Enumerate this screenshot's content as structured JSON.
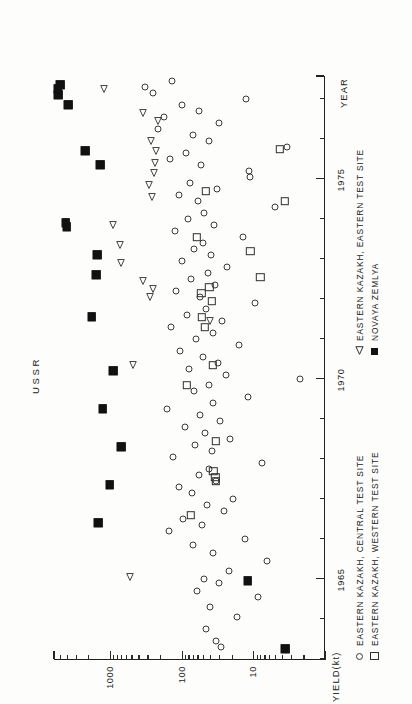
{
  "chart_data": {
    "type": "scatter",
    "title": "USSR",
    "xlabel": "YEAR",
    "ylabel": "YIELD(kt)",
    "yscale": "log",
    "xlim": [
      1963.0,
      1977.6
    ],
    "ylim": [
      1.0,
      6000.0
    ],
    "xticks": [
      1965,
      1970,
      1975
    ],
    "xtick_labels": [
      "1965",
      "1970",
      "1975"
    ],
    "xminor_step": 1,
    "yticks": [
      10,
      100,
      1000
    ],
    "ytick_labels": [
      "10",
      "100",
      "1000"
    ],
    "grid": false,
    "legend_position": "below-axes",
    "legend": [
      {
        "symbol": "open-circle",
        "label": "EASTERN KAZAKH, CENTRAL TEST SITE"
      },
      {
        "symbol": "open-square",
        "label": "EASTERN KAZAKH, WESTERN TEST SITE"
      },
      {
        "symbol": "open-triangle",
        "label": "EASTERN KAZAKH, EASTERN TEST SITE"
      },
      {
        "symbol": "filled-square",
        "label": "NOVAYA ZEMLYA"
      }
    ],
    "series": [
      {
        "name": "EASTERN KAZAKH, CENTRAL TEST SITE",
        "symbol": "open-circle",
        "points": [
          [
            1963.3,
            28
          ],
          [
            1963.45,
            33
          ],
          [
            1963.75,
            46
          ],
          [
            1964.05,
            17
          ],
          [
            1964.3,
            40
          ],
          [
            1964.55,
            8.5
          ],
          [
            1964.7,
            60
          ],
          [
            1964.9,
            30
          ],
          [
            1965.0,
            48
          ],
          [
            1965.2,
            22
          ],
          [
            1965.45,
            6.5
          ],
          [
            1965.65,
            36
          ],
          [
            1965.85,
            70
          ],
          [
            1966.0,
            13
          ],
          [
            1966.2,
            150
          ],
          [
            1966.35,
            52
          ],
          [
            1966.5,
            95
          ],
          [
            1966.7,
            26
          ],
          [
            1966.85,
            44
          ],
          [
            1967.0,
            19
          ],
          [
            1967.15,
            72
          ],
          [
            1967.3,
            110
          ],
          [
            1967.45,
            33
          ],
          [
            1967.6,
            58
          ],
          [
            1967.75,
            42
          ],
          [
            1967.9,
            7.5
          ],
          [
            1968.05,
            130
          ],
          [
            1968.2,
            38
          ],
          [
            1968.35,
            64
          ],
          [
            1968.5,
            21
          ],
          [
            1968.65,
            47
          ],
          [
            1968.8,
            90
          ],
          [
            1968.95,
            29
          ],
          [
            1969.1,
            55
          ],
          [
            1969.25,
            160
          ],
          [
            1969.4,
            36
          ],
          [
            1969.55,
            12
          ],
          [
            1969.7,
            68
          ],
          [
            1969.85,
            41
          ],
          [
            1970.0,
            2.2
          ],
          [
            1970.1,
            24
          ],
          [
            1970.25,
            78
          ],
          [
            1970.4,
            31
          ],
          [
            1970.55,
            50
          ],
          [
            1970.7,
            105
          ],
          [
            1970.85,
            16
          ],
          [
            1971.0,
            62
          ],
          [
            1971.15,
            37
          ],
          [
            1971.3,
            140
          ],
          [
            1971.45,
            27
          ],
          [
            1971.6,
            85
          ],
          [
            1971.75,
            45
          ],
          [
            1971.9,
            9.5
          ],
          [
            1972.05,
            56
          ],
          [
            1972.2,
            118
          ],
          [
            1972.35,
            34
          ],
          [
            1972.5,
            73
          ],
          [
            1972.65,
            43
          ],
          [
            1972.8,
            23
          ],
          [
            1972.95,
            98
          ],
          [
            1973.1,
            39
          ],
          [
            1973.25,
            66
          ],
          [
            1973.4,
            51
          ],
          [
            1973.55,
            14
          ],
          [
            1973.7,
            125
          ],
          [
            1973.85,
            35
          ],
          [
            1974.0,
            80
          ],
          [
            1974.15,
            49
          ],
          [
            1974.3,
            5.0
          ],
          [
            1974.45,
            59
          ],
          [
            1974.6,
            108
          ],
          [
            1974.75,
            32
          ],
          [
            1974.9,
            76
          ],
          [
            1975.05,
            11
          ],
          [
            1975.2,
            11.5
          ],
          [
            1975.35,
            54
          ],
          [
            1975.5,
            145
          ],
          [
            1975.65,
            88
          ],
          [
            1975.8,
            3.4
          ],
          [
            1975.95,
            41
          ],
          [
            1976.1,
            69
          ],
          [
            1976.25,
            210
          ],
          [
            1976.4,
            30
          ],
          [
            1976.55,
            175
          ],
          [
            1976.7,
            57
          ],
          [
            1976.85,
            100
          ],
          [
            1977.0,
            12.5
          ],
          [
            1977.15,
            250
          ],
          [
            1977.3,
            320
          ],
          [
            1977.45,
            135
          ]
        ]
      },
      {
        "name": "EASTERN KAZAKH, WESTERN TEST SITE",
        "symbol": "open-square",
        "points": [
          [
            1966.6,
            75
          ],
          [
            1967.55,
            34
          ],
          [
            1967.7,
            36
          ],
          [
            1968.45,
            33
          ],
          [
            1969.85,
            84
          ],
          [
            1970.35,
            37
          ],
          [
            1971.3,
            47
          ],
          [
            1971.55,
            52
          ],
          [
            1971.95,
            38
          ],
          [
            1972.15,
            53
          ],
          [
            1972.3,
            41
          ],
          [
            1972.55,
            8.0
          ],
          [
            1973.2,
            11
          ],
          [
            1973.55,
            61
          ],
          [
            1974.45,
            3.6
          ],
          [
            1974.7,
            46
          ],
          [
            1975.75,
            4.3
          ],
          [
            1967.45,
            33.5
          ]
        ]
      },
      {
        "name": "EASTERN KAZAKH, EASTERN TEST SITE",
        "symbol": "open-triangle",
        "points": [
          [
            1965.05,
            640
          ],
          [
            1970.35,
            570
          ],
          [
            1971.45,
            48
          ],
          [
            1972.05,
            330
          ],
          [
            1972.25,
            300
          ],
          [
            1972.9,
            850
          ],
          [
            1973.35,
            880
          ],
          [
            1973.85,
            1100
          ],
          [
            1974.55,
            310
          ],
          [
            1974.85,
            340
          ],
          [
            1975.15,
            290
          ],
          [
            1975.4,
            280
          ],
          [
            1975.7,
            270
          ],
          [
            1975.95,
            320
          ],
          [
            1976.45,
            260
          ],
          [
            1976.65,
            420
          ],
          [
            1977.25,
            1450
          ],
          [
            1972.45,
            410
          ]
        ]
      },
      {
        "name": "NOVAYA ZEMLYA",
        "symbol": "filled-square",
        "points": [
          [
            1963.25,
            3.6
          ],
          [
            1964.95,
            12
          ],
          [
            1966.4,
            1450
          ],
          [
            1967.35,
            1000
          ],
          [
            1968.3,
            700
          ],
          [
            1969.25,
            1250
          ],
          [
            1970.2,
            900
          ],
          [
            1971.55,
            1800
          ],
          [
            1972.6,
            1550
          ],
          [
            1973.1,
            1500
          ],
          [
            1973.8,
            4000
          ],
          [
            1973.9,
            4100
          ],
          [
            1975.35,
            1350
          ],
          [
            1975.7,
            2200
          ],
          [
            1976.85,
            3800
          ],
          [
            1977.1,
            5200
          ],
          [
            1977.35,
            4900
          ],
          [
            1977.25,
            5300
          ]
        ]
      }
    ]
  }
}
